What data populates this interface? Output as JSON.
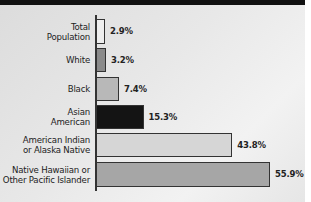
{
  "chart_data": {
    "type": "bar",
    "orientation": "horizontal",
    "title": "",
    "xlabel": "",
    "ylabel": "",
    "categories": [
      "Total Population",
      "White",
      "Black",
      "Asian American",
      "American Indian or Alaska Native",
      "Native Hawaiian or Other Pacific Islander"
    ],
    "values": [
      2.9,
      3.2,
      7.4,
      15.3,
      43.8,
      55.9
    ],
    "value_labels": [
      "2.9%",
      "3.2%",
      "7.4%",
      "15.3%",
      "43.8%",
      "55.9%"
    ],
    "bar_colors": [
      "#eeeeee",
      "#8a8a8a",
      "#b8b8b8",
      "#141414",
      "#d6d6d6",
      "#a6a6a6"
    ],
    "grid": false,
    "legend": "none",
    "xlim": [
      0,
      60
    ]
  },
  "rows": [
    {
      "label": "Total\nPopulation",
      "value": "2.9%",
      "pct": 2.9,
      "color": "#eeeeee",
      "top": 19,
      "height": 25
    },
    {
      "label": "White",
      "value": "3.2%",
      "pct": 3.2,
      "color": "#8a8a8a",
      "top": 48,
      "height": 24
    },
    {
      "label": "Black",
      "value": "7.4%",
      "pct": 7.4,
      "color": "#b8b8b8",
      "top": 77,
      "height": 24
    },
    {
      "label": "Asian\nAmerican",
      "value": "15.3%",
      "pct": 15.3,
      "color": "#141414",
      "top": 105,
      "height": 24
    },
    {
      "label": "American Indian\nor Alaska Native",
      "value": "43.8%",
      "pct": 43.8,
      "color": "#d6d6d6",
      "top": 133,
      "height": 24
    },
    {
      "label": "Native Hawaiian or\nOther Pacific Islander",
      "value": "55.9%",
      "pct": 55.9,
      "color": "#a6a6a6",
      "top": 162,
      "height": 25
    }
  ]
}
